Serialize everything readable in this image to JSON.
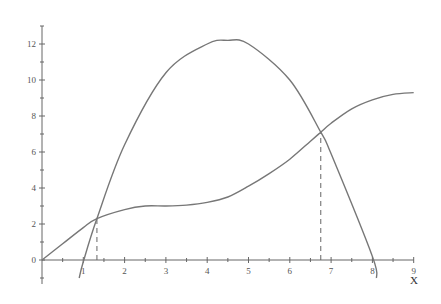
{
  "chart_data": {
    "type": "line",
    "title": "",
    "xlabel": "X",
    "ylabel": "",
    "xlim": [
      0,
      9
    ],
    "ylim": [
      -1,
      13
    ],
    "x_ticks": [
      1,
      2,
      3,
      4,
      5,
      6,
      7,
      8,
      9
    ],
    "y_ticks": [
      0,
      2,
      4,
      6,
      8,
      10,
      12
    ],
    "grid": false,
    "legend": null,
    "series": [
      {
        "name": "parabola",
        "x": [
          0.9,
          1.0,
          1.33,
          2.0,
          3.0,
          4.0,
          4.5,
          5.0,
          6.0,
          6.75,
          7.0,
          8.0,
          8.1
        ],
        "y": [
          -1.0,
          -0.1,
          2.3,
          6.4,
          10.4,
          12.0,
          12.2,
          12.0,
          10.0,
          7.1,
          5.9,
          0.2,
          -1.0
        ]
      },
      {
        "name": "cubic",
        "x": [
          0,
          0.5,
          1.0,
          1.33,
          2.0,
          2.5,
          3.0,
          3.5,
          4.0,
          4.5,
          5.0,
          5.5,
          6.0,
          6.5,
          6.75,
          7.0,
          7.5,
          8.0,
          8.5,
          9.0
        ],
        "y": [
          0,
          0.9,
          1.8,
          2.3,
          2.8,
          3.0,
          3.0,
          3.05,
          3.2,
          3.5,
          4.1,
          4.8,
          5.6,
          6.6,
          7.1,
          7.6,
          8.4,
          8.9,
          9.2,
          9.3
        ]
      }
    ],
    "annotations": [
      {
        "type": "dashed-vertical",
        "x": 1.33,
        "y_top": 2.3,
        "label": "intersection 1"
      },
      {
        "type": "dashed-vertical",
        "x": 6.75,
        "y_top": 7.1,
        "label": "intersection 2"
      }
    ]
  },
  "labels": {
    "x_axis_title": "X",
    "x_tick_labels": [
      "1",
      "2",
      "3",
      "4",
      "5",
      "6",
      "7",
      "8",
      "9"
    ],
    "y_tick_labels": [
      "0",
      "2",
      "4",
      "6",
      "8",
      "10",
      "12"
    ],
    "origin_label": "0"
  },
  "colors": {
    "curve": "#777777",
    "axis": "#666666",
    "text": "#555555"
  }
}
